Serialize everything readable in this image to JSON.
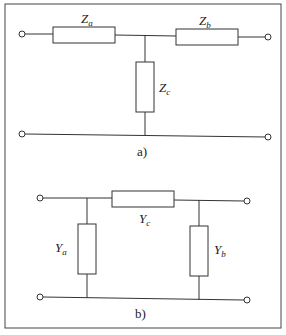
{
  "diagram": {
    "panel_a": {
      "caption": "a)",
      "elements": [
        {
          "id": "Za",
          "symbol": "Z",
          "subscript": "a",
          "type": "impedance",
          "placement": "series-left"
        },
        {
          "id": "Zb",
          "symbol": "Z",
          "subscript": "b",
          "type": "impedance",
          "placement": "series-right"
        },
        {
          "id": "Zc",
          "symbol": "Z",
          "subscript": "c",
          "type": "impedance",
          "placement": "shunt-center"
        }
      ]
    },
    "panel_b": {
      "caption": "b)",
      "elements": [
        {
          "id": "Yc",
          "symbol": "Y",
          "subscript": "c",
          "type": "admittance",
          "placement": "series-center"
        },
        {
          "id": "Ya",
          "symbol": "Y",
          "subscript": "a",
          "type": "admittance",
          "placement": "shunt-left"
        },
        {
          "id": "Yb",
          "symbol": "Y",
          "subscript": "b",
          "type": "admittance",
          "placement": "shunt-right"
        }
      ]
    }
  }
}
